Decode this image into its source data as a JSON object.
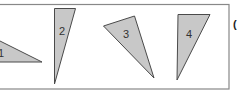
{
  "figure": {
    "triangles": [
      {
        "id": 1,
        "label": "1"
      },
      {
        "id": 2,
        "label": "2"
      },
      {
        "id": 3,
        "label": "3"
      },
      {
        "id": 4,
        "label": "4"
      }
    ],
    "fill_color": "#c8c8c8",
    "stroke_color": "#4a4a4a",
    "trailing_mark": "("
  }
}
